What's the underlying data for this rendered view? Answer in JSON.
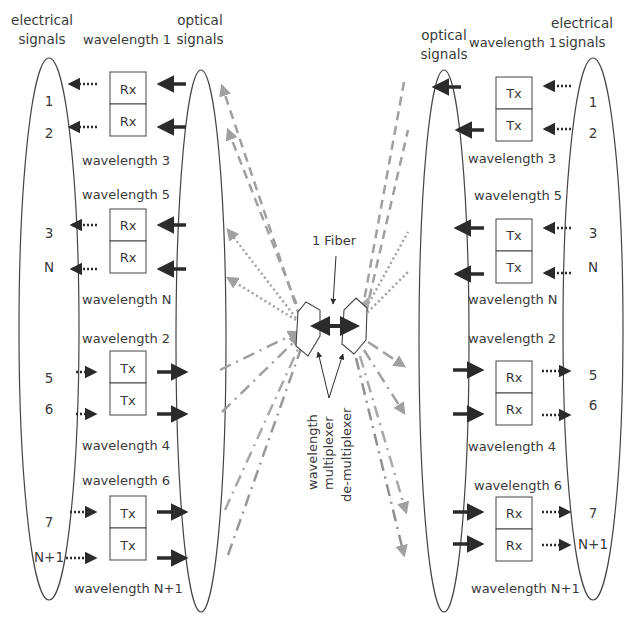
{
  "colors": {
    "ink": "#3a3a3a",
    "arrow_dark": "#2b2b2b",
    "arrow_gray": "#9a9a9a",
    "arrow_gray_light": "#b0b0b0",
    "background": "#ffffff"
  },
  "left": {
    "electrical_header": [
      "electrical",
      "signals"
    ],
    "optical_header": [
      "optical",
      "signals"
    ],
    "wavelength_top": "wavelength 1",
    "groups": [
      {
        "direction": "receive",
        "box_label": "Rx",
        "wavelength_after": "wavelength 3",
        "rows": [
          {
            "signal": "1",
            "box": "Rx"
          },
          {
            "signal": "2",
            "box": "Rx"
          }
        ]
      },
      {
        "direction": "receive",
        "wavelength_before": "wavelength 5",
        "wavelength_after": "wavelength N",
        "rows": [
          {
            "signal": "3",
            "box": "Rx"
          },
          {
            "signal": "N",
            "box": "Rx"
          }
        ]
      },
      {
        "direction": "transmit",
        "wavelength_before": "wavelength 2",
        "wavelength_after": "wavelength 4",
        "rows": [
          {
            "signal": "5",
            "box": "Tx"
          },
          {
            "signal": "6",
            "box": "Tx"
          }
        ]
      },
      {
        "direction": "transmit",
        "wavelength_before": "wavelength 6",
        "wavelength_after": "wavelength N+1",
        "rows": [
          {
            "signal": "7",
            "box": "Tx"
          },
          {
            "signal": "N+1",
            "box": "Tx"
          }
        ]
      }
    ]
  },
  "right": {
    "electrical_header": [
      "electrical",
      "signals"
    ],
    "optical_header": [
      "optical",
      "signals"
    ],
    "wavelength_top": "wavelength 1",
    "groups": [
      {
        "direction": "transmit",
        "wavelength_after": "wavelength 3",
        "rows": [
          {
            "signal": "1",
            "box": "Tx"
          },
          {
            "signal": "2",
            "box": "Tx"
          }
        ]
      },
      {
        "direction": "transmit",
        "wavelength_before": "wavelength 5",
        "wavelength_after": "wavelength N",
        "rows": [
          {
            "signal": "3",
            "box": "Tx"
          },
          {
            "signal": "N",
            "box": "Tx"
          }
        ]
      },
      {
        "direction": "receive",
        "wavelength_before": "wavelength 2",
        "wavelength_after": "wavelength 4",
        "rows": [
          {
            "signal": "5",
            "box": "Rx"
          },
          {
            "signal": "6",
            "box": "Rx"
          }
        ]
      },
      {
        "direction": "receive",
        "wavelength_before": "wavelength 6",
        "wavelength_after": "wavelength N+1",
        "rows": [
          {
            "signal": "7",
            "box": "Rx"
          },
          {
            "signal": "N+1",
            "box": "Rx"
          }
        ]
      }
    ]
  },
  "center": {
    "fiber_label": "1 Fiber",
    "mux_label": [
      "wavelength",
      "multiplexer",
      "de-multiplexer"
    ]
  }
}
